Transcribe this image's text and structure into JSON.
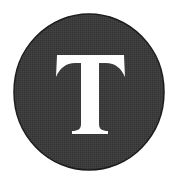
{
  "logo": {
    "letter": "T",
    "circle_color": "#3a3a3a",
    "circle_edge_color": "#1a1a1a",
    "letter_color": "#ffffff",
    "background_color": "#ffffff"
  }
}
